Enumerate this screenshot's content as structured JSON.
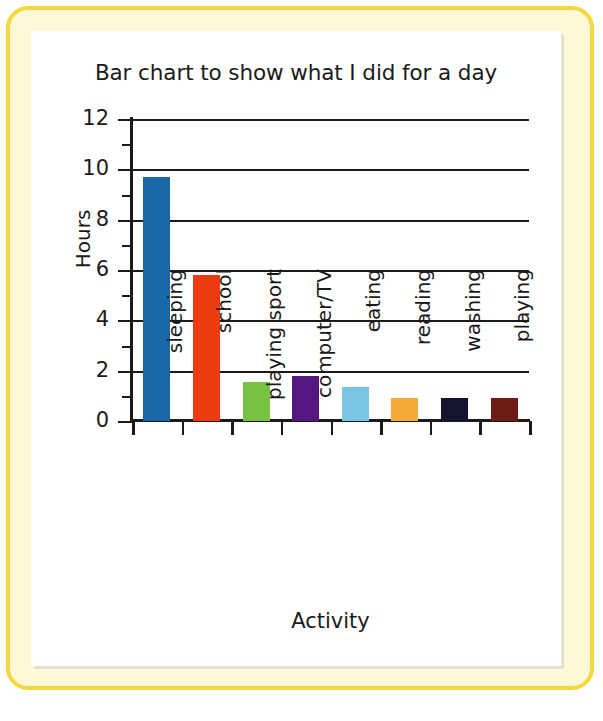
{
  "frame": {
    "border_color": "#f3d93c",
    "backdrop_color": "#fdf8d7",
    "panel_color": "#ffffff"
  },
  "chart_data": {
    "type": "bar",
    "title": "Bar chart to show what I did for a day",
    "xlabel": "Activity",
    "ylabel": "Hours",
    "ylim": [
      0,
      12
    ],
    "ytick_step": 2,
    "yticks": [
      "0",
      "2",
      "4",
      "6",
      "8",
      "10",
      "12"
    ],
    "ytick_values": [
      0,
      2,
      4,
      6,
      8,
      10,
      12
    ],
    "minor_tick_values": [
      1,
      3,
      5,
      7,
      9,
      11
    ],
    "grid": "horizontal",
    "legend": "none",
    "categories": [
      "sleeping",
      "school",
      "playing sport",
      "computer/TV",
      "eating",
      "reading",
      "washing",
      "playing"
    ],
    "values": [
      9.7,
      5.8,
      1.55,
      1.8,
      1.35,
      0.9,
      0.9,
      0.9
    ],
    "colors": [
      "#1a67a8",
      "#ec3b10",
      "#78c143",
      "#561680",
      "#79c5e3",
      "#f7a937",
      "#141430",
      "#6d1c15"
    ],
    "bars": [
      {
        "label": "sleeping",
        "value": 9.7,
        "color": "#1a67a8"
      },
      {
        "label": "school",
        "value": 5.8,
        "color": "#ec3b10"
      },
      {
        "label": "playing sport",
        "value": 1.55,
        "color": "#78c143"
      },
      {
        "label": "computer/TV",
        "value": 1.8,
        "color": "#561680"
      },
      {
        "label": "eating",
        "value": 1.35,
        "color": "#79c5e3"
      },
      {
        "label": "reading",
        "value": 0.9,
        "color": "#f7a937"
      },
      {
        "label": "washing",
        "value": 0.9,
        "color": "#141430"
      },
      {
        "label": "playing",
        "value": 0.9,
        "color": "#6d1c15"
      }
    ]
  }
}
